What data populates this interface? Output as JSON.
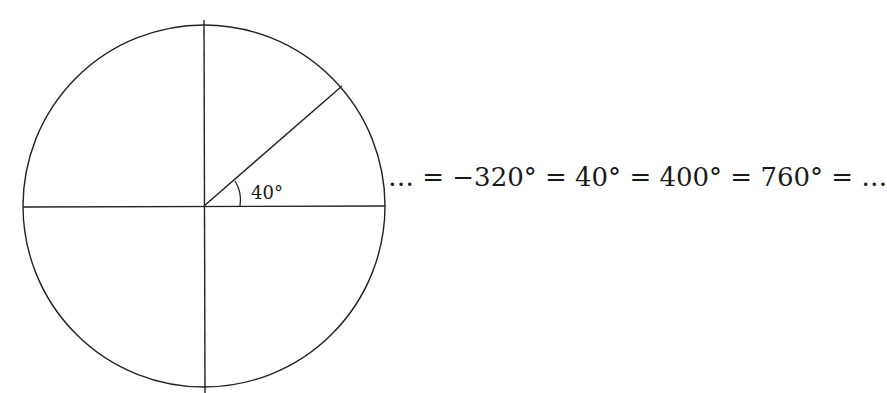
{
  "diagram": {
    "type": "unit-circle-angle",
    "circle": {
      "cx": 204,
      "cy": 206,
      "r": 181
    },
    "stroke_color": "#222222",
    "angle": {
      "degrees": 40,
      "label": "40°"
    },
    "equation": "… = −320° = 40° = 400° = 760° = …",
    "coterminal_angles": [
      -320,
      40,
      400,
      760
    ]
  }
}
